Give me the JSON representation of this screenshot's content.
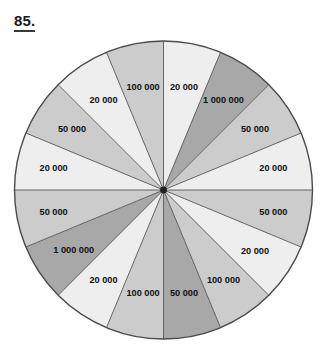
{
  "page": {
    "problem_number": "85.",
    "background_color": "#ffffff"
  },
  "wheel": {
    "name": "prize-spinner-wheel",
    "center_x": 163.5,
    "center_y": 190,
    "radius": 149,
    "outline_color": "#4a4a4a",
    "divider_color": "#555555",
    "hub_color": "#222222",
    "sector_count": 16,
    "sector_angle_deg": 22.5,
    "palette": {
      "light": "#eeeeee",
      "medium": "#cccccc",
      "dark": "#a8a8a8"
    }
  },
  "chart_data": {
    "type": "pie",
    "title": "85.",
    "xlabel": "",
    "ylabel": "",
    "legend_position": "none",
    "grid": false,
    "note": "16 equal sectors of 22.5 degrees each on a spinner wheel; labels read clockwise starting at the 12 o'clock position",
    "categories": [
      "20 000",
      "1 000 000",
      "50 000",
      "20 000",
      "50 000",
      "20 000",
      "100 000",
      "50 000",
      "100 000",
      "20 000",
      "1 000 000",
      "50 000",
      "20 000",
      "50 000",
      "20 000",
      "100 000"
    ],
    "values": [
      6.25,
      6.25,
      6.25,
      6.25,
      6.25,
      6.25,
      6.25,
      6.25,
      6.25,
      6.25,
      6.25,
      6.25,
      6.25,
      6.25,
      6.25,
      6.25
    ],
    "prize_amounts": [
      20000,
      1000000,
      50000,
      20000,
      50000,
      20000,
      100000,
      50000,
      100000,
      20000,
      1000000,
      50000,
      20000,
      50000,
      20000,
      100000
    ],
    "prize_counts": {
      "20 000": 6,
      "50 000": 4,
      "100 000": 3,
      "1 000 000": 2
    }
  },
  "sectors": [
    {
      "label": "20 000",
      "start_deg": 0,
      "end_deg": 22.5,
      "shade": "light",
      "label_radius": 105,
      "label_angle": 11.25
    },
    {
      "label": "1 000 000",
      "start_deg": 22.5,
      "end_deg": 45,
      "shade": "dark",
      "label_radius": 108,
      "label_angle": 33.75
    },
    {
      "label": "50 000",
      "start_deg": 45,
      "end_deg": 67.5,
      "shade": "medium",
      "label_radius": 110,
      "label_angle": 56.25
    },
    {
      "label": "20 000",
      "start_deg": 67.5,
      "end_deg": 90,
      "shade": "light",
      "label_radius": 112,
      "label_angle": 78.75
    },
    {
      "label": "50 000",
      "start_deg": 90,
      "end_deg": 112.5,
      "shade": "medium",
      "label_radius": 112,
      "label_angle": 101.25
    },
    {
      "label": "20 000",
      "start_deg": 112.5,
      "end_deg": 135,
      "shade": "light",
      "label_radius": 110,
      "label_angle": 123.75
    },
    {
      "label": "100 000",
      "start_deg": 135,
      "end_deg": 157.5,
      "shade": "medium",
      "label_radius": 108,
      "label_angle": 146.25
    },
    {
      "label": "50 000",
      "start_deg": 157.5,
      "end_deg": 180,
      "shade": "dark",
      "label_radius": 105,
      "label_angle": 168.75
    },
    {
      "label": "100 000",
      "start_deg": 180,
      "end_deg": 202.5,
      "shade": "medium",
      "label_radius": 105,
      "label_angle": 191.25
    },
    {
      "label": "20 000",
      "start_deg": 202.5,
      "end_deg": 225,
      "shade": "light",
      "label_radius": 108,
      "label_angle": 213.75
    },
    {
      "label": "1 000 000",
      "start_deg": 225,
      "end_deg": 247.5,
      "shade": "dark",
      "label_radius": 108,
      "label_angle": 236.25
    },
    {
      "label": "50 000",
      "start_deg": 247.5,
      "end_deg": 270,
      "shade": "medium",
      "label_radius": 112,
      "label_angle": 258.75
    },
    {
      "label": "20 000",
      "start_deg": 270,
      "end_deg": 292.5,
      "shade": "light",
      "label_radius": 112,
      "label_angle": 281.25
    },
    {
      "label": "50 000",
      "start_deg": 292.5,
      "end_deg": 315,
      "shade": "medium",
      "label_radius": 110,
      "label_angle": 303.75
    },
    {
      "label": "20 000",
      "start_deg": 315,
      "end_deg": 337.5,
      "shade": "light",
      "label_radius": 108,
      "label_angle": 326.25
    },
    {
      "label": "100 000",
      "start_deg": 337.5,
      "end_deg": 360,
      "shade": "medium",
      "label_radius": 105,
      "label_angle": 348.75
    }
  ]
}
